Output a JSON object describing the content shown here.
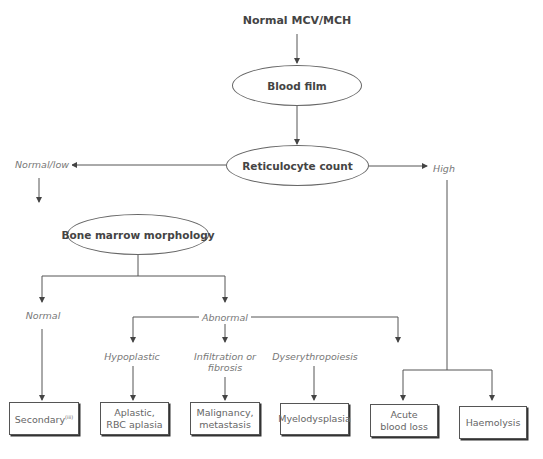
{
  "diagram": {
    "type": "flowchart",
    "start": "Normal MCV/MCH",
    "nodes": {
      "blood_film": "Blood film",
      "reticulocyte_count": "Reticulocyte count",
      "bone_marrow": "Bone marrow morphology"
    },
    "branches": {
      "normal_low": "Normal/low",
      "high": "High",
      "normal": "Normal",
      "abnormal": "Abnormal",
      "hypoplastic": "Hypoplastic",
      "infiltration_line1": "Infiltration or",
      "infiltration_line2": "fibrosis",
      "dyserythropoiesis": "Dyserythropoiesis"
    },
    "outcomes": {
      "secondary": "Secondary",
      "secondary_sup": "(iii)",
      "aplastic_line1": "Aplastic,",
      "aplastic_line2": "RBC aplasia",
      "malignancy_line1": "Malignancy,",
      "malignancy_line2": "metastasis",
      "myelodysplasia": "Myelodysplasia",
      "acute_line1": "Acute",
      "acute_line2": "blood loss",
      "haemolysis": "Haemolysis"
    },
    "colors": {
      "line": "#555555",
      "text": "#444444",
      "label": "#777777"
    }
  }
}
